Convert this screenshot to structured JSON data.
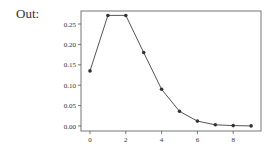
{
  "prompt": {
    "label": "Out:"
  },
  "chart_data": {
    "type": "line",
    "title": "",
    "xlabel": "",
    "ylabel": "",
    "x": [
      0,
      1,
      2,
      3,
      4,
      5,
      6,
      7,
      8,
      9
    ],
    "series": [
      {
        "name": "",
        "values": [
          0.135,
          0.271,
          0.271,
          0.18,
          0.09,
          0.036,
          0.012,
          0.003,
          0.001,
          0.0002
        ]
      }
    ],
    "xticks": [
      0,
      2,
      4,
      6,
      8
    ],
    "xtick_labels": [
      "0",
      "2",
      "4",
      "6",
      "8"
    ],
    "yticks": [
      0.0,
      0.05,
      0.1,
      0.15,
      0.2,
      0.25
    ],
    "ytick_labels": [
      "0.00",
      "0.05",
      "0.10",
      "0.15",
      "0.20",
      "0.25"
    ],
    "xlim": [
      -0.5,
      9.5
    ],
    "ylim": [
      -0.013,
      0.284
    ],
    "grid": false,
    "legend": null,
    "marker": "circle",
    "line_color": "#555555",
    "marker_color": "#333333"
  }
}
